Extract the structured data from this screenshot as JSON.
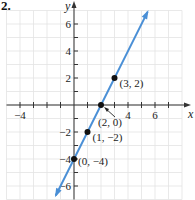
{
  "problem_label": "2.",
  "colors": {
    "line": "#4a8fd6",
    "axis": "#333333",
    "grid": "#e3e3e3",
    "point": "#111111"
  },
  "chart_data": {
    "type": "line",
    "title": "",
    "equation": "y = 2x - 4",
    "xlabel": "x",
    "ylabel": "y",
    "xlim": [
      -5,
      8
    ],
    "ylim": [
      -7,
      7
    ],
    "grid": true,
    "x_tick_labels": [
      "-4",
      "4",
      "6"
    ],
    "y_tick_labels": [
      "6",
      "4",
      "2",
      "-2",
      "-4",
      "-6"
    ],
    "points": [
      {
        "x": 0,
        "y": -4,
        "label": "(0, -4)"
      },
      {
        "x": 1,
        "y": -2,
        "label": "(1, -2)"
      },
      {
        "x": 2,
        "y": 0,
        "label": "(2, 0)"
      },
      {
        "x": 3,
        "y": 2,
        "label": "(3, 2)"
      }
    ]
  }
}
